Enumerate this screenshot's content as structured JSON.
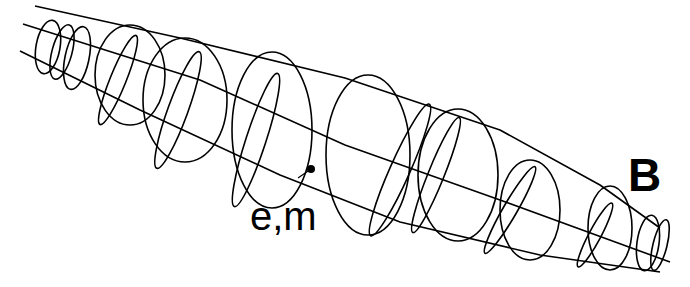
{
  "figure": {
    "labels": {
      "source_label": "e,m",
      "field_label": "B"
    },
    "colors": {
      "background": "#ffffff",
      "ink": "#000000"
    },
    "point": {
      "name": "source-point",
      "x": 311,
      "y": 169
    },
    "guide_lines": [
      {
        "name": "upper-envelope",
        "points": [
          [
            35,
            6
          ],
          [
            180,
            38
          ],
          [
            345,
            78
          ],
          [
            500,
            130
          ],
          [
            600,
            185
          ],
          [
            660,
            228
          ]
        ]
      },
      {
        "name": "center-axis",
        "points": [
          [
            23,
            24
          ],
          [
            200,
            80
          ],
          [
            345,
            145
          ],
          [
            500,
            200
          ],
          [
            670,
            262
          ]
        ]
      },
      {
        "name": "lower-envelope",
        "points": [
          [
            20,
            51
          ],
          [
            140,
            110
          ],
          [
            280,
            175
          ],
          [
            400,
            222
          ],
          [
            540,
            255
          ],
          [
            660,
            272
          ]
        ]
      }
    ],
    "ellipses": [
      {
        "cx": 48,
        "cy": 47,
        "rx": 12,
        "ry": 27,
        "rot": 10
      },
      {
        "cx": 62,
        "cy": 52,
        "rx": 10,
        "ry": 28,
        "rot": 15
      },
      {
        "cx": 77,
        "cy": 58,
        "rx": 12,
        "ry": 32,
        "rot": 12
      },
      {
        "cx": 130,
        "cy": 75,
        "rx": 35,
        "ry": 50,
        "rot": 0
      },
      {
        "cx": 118,
        "cy": 80,
        "rx": 8,
        "ry": 48,
        "rot": 22
      },
      {
        "cx": 185,
        "cy": 100,
        "rx": 42,
        "ry": 62,
        "rot": 0
      },
      {
        "cx": 178,
        "cy": 110,
        "rx": 10,
        "ry": 62,
        "rot": 20
      },
      {
        "cx": 272,
        "cy": 130,
        "rx": 40,
        "ry": 78,
        "rot": 0
      },
      {
        "cx": 256,
        "cy": 140,
        "rx": 10,
        "ry": 70,
        "rot": 18
      },
      {
        "cx": 368,
        "cy": 155,
        "rx": 42,
        "ry": 80,
        "rot": 0
      },
      {
        "cx": 400,
        "cy": 170,
        "rx": 10,
        "ry": 72,
        "rot": 24
      },
      {
        "cx": 458,
        "cy": 175,
        "rx": 40,
        "ry": 66,
        "rot": 0
      },
      {
        "cx": 436,
        "cy": 175,
        "rx": 8,
        "ry": 62,
        "rot": 22
      },
      {
        "cx": 530,
        "cy": 210,
        "rx": 30,
        "ry": 50,
        "rot": 0
      },
      {
        "cx": 510,
        "cy": 210,
        "rx": 7,
        "ry": 50,
        "rot": 30
      },
      {
        "cx": 610,
        "cy": 228,
        "rx": 22,
        "ry": 42,
        "rot": 0
      },
      {
        "cx": 595,
        "cy": 235,
        "rx": 6,
        "ry": 36,
        "rot": 28
      },
      {
        "cx": 648,
        "cy": 243,
        "rx": 11,
        "ry": 28,
        "rot": 8
      },
      {
        "cx": 660,
        "cy": 245,
        "rx": 7,
        "ry": 26,
        "rot": 14
      }
    ]
  }
}
